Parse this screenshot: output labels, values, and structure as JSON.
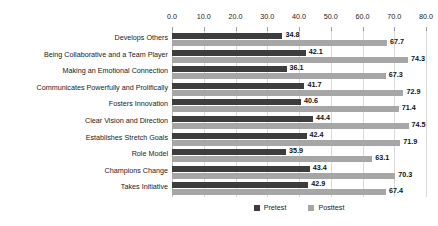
{
  "chart_data": {
    "type": "bar",
    "orientation": "horizontal",
    "title": "",
    "xlabel": "",
    "ylabel": "",
    "xlim": [
      0,
      80
    ],
    "xticks": [
      "0.0",
      "10.0",
      "20.0",
      "30.0",
      "40.0",
      "50.0",
      "60.0",
      "70.0",
      "80.0"
    ],
    "xtick_values": [
      0,
      10,
      20,
      30,
      40,
      50,
      60,
      70,
      80
    ],
    "grid": true,
    "grid_axis": "x",
    "legend_position": "bottom-center",
    "categories": [
      "Develops Others",
      "Being Collaborative and a Team Player",
      "Making an Emotional Connection",
      "Communicates Powerfully and Prolifically",
      "Fosters Innovation",
      "Clear Vision and Direction",
      "Establishes Stretch Goals",
      "Role Model",
      "Champions Change",
      "Takes Initiative"
    ],
    "series": [
      {
        "name": "Pretest",
        "color": "#3d3d3d",
        "values": [
          34.8,
          42.1,
          36.1,
          41.7,
          40.6,
          44.4,
          42.4,
          35.9,
          43.4,
          42.9
        ],
        "labels": [
          "34.8",
          "42.1",
          "36.1",
          "41.7",
          "40.6",
          "44.4",
          "42.4",
          "35.9",
          "43.4",
          "42.9"
        ]
      },
      {
        "name": "Posttest",
        "color": "#a6a6a6",
        "values": [
          67.7,
          74.3,
          67.3,
          72.9,
          71.4,
          74.5,
          71.9,
          63.1,
          70.3,
          67.4
        ],
        "labels": [
          "67.7",
          "74.3",
          "67.3",
          "72.9",
          "71.4",
          "74.5",
          "71.9",
          "63.1",
          "70.3",
          "67.4"
        ]
      }
    ]
  },
  "legend": {
    "items": [
      {
        "label": "Pretest",
        "color": "#3d3d3d"
      },
      {
        "label": "Posttest",
        "color": "#a6a6a6"
      }
    ]
  }
}
